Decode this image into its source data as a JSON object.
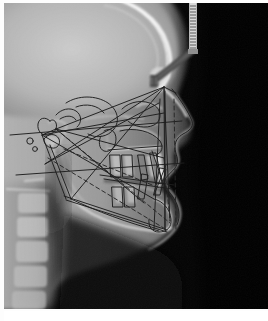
{
  "figure": {
    "kind": "lateral-cephalometric-radiograph",
    "modality": "X-ray",
    "view": "lateral / profile, patient facing right",
    "title": "",
    "caption": "",
    "frame": {
      "background_color": "#ffffff",
      "image_left": 4,
      "image_top": 3,
      "image_width": 264,
      "image_height": 306
    }
  },
  "radiograph": {
    "background_color": "#000000",
    "air_field_color": "#050505",
    "soft_tissue_color": "#8d8d8d",
    "bone_color": "#cfcfcf",
    "bright_bone_color": "#f2f2f2",
    "cranial_vault_color": "#b9b9b9",
    "anatomy_labels": [
      "cranial-vault",
      "frontal-bone",
      "orbital-rim",
      "nasal-bone",
      "maxilla",
      "mandible",
      "soft-tissue-profile",
      "nose",
      "upper-lip",
      "lower-lip",
      "chin",
      "cervical-vertebrae",
      "upper-incisor",
      "lower-incisor",
      "sella-turcica",
      "hard-palate"
    ]
  },
  "hardware": {
    "ruler": {
      "name": "calibration-ruler",
      "color": "#d9d9d9",
      "x": 189,
      "y": 3,
      "width": 7,
      "height": 48,
      "tick_count": 18
    },
    "ear_rod": {
      "name": "cephalostat-ear-rod",
      "color": "#4a4a4a",
      "description": "angled positioning bar descending left from ruler base"
    }
  },
  "tracing": {
    "line_color": "#202020",
    "dashed_line_color": "#2a2a2a",
    "stroke_width": 0.9,
    "landmarks": [
      {
        "name": "nasion",
        "x": 160,
        "y": 84
      },
      {
        "name": "sella",
        "x": 52,
        "y": 126
      },
      {
        "name": "porion",
        "x": 38,
        "y": 132
      },
      {
        "name": "orbitale",
        "x": 143,
        "y": 118
      },
      {
        "name": "basion",
        "x": 41,
        "y": 161
      },
      {
        "name": "articulare",
        "x": 44,
        "y": 158
      },
      {
        "name": "anterior-nasal-spine",
        "x": 158,
        "y": 143
      },
      {
        "name": "posterior-nasal-spine",
        "x": 104,
        "y": 146
      },
      {
        "name": "point-a",
        "x": 160,
        "y": 155
      },
      {
        "name": "point-b",
        "x": 163,
        "y": 205
      },
      {
        "name": "pogonion",
        "x": 166,
        "y": 218
      },
      {
        "name": "menton",
        "x": 161,
        "y": 227
      },
      {
        "name": "gnathion",
        "x": 163,
        "y": 224
      },
      {
        "name": "gonion",
        "x": 67,
        "y": 196
      },
      {
        "name": "condylion",
        "x": 46,
        "y": 142
      }
    ],
    "reference_lines": [
      {
        "name": "sella-nasion-line",
        "style": "solid"
      },
      {
        "name": "frankfort-horizontal",
        "style": "solid"
      },
      {
        "name": "palatal-plane",
        "style": "solid"
      },
      {
        "name": "mandibular-plane",
        "style": "solid"
      },
      {
        "name": "occlusal-plane",
        "style": "solid"
      },
      {
        "name": "facial-plane",
        "style": "solid"
      },
      {
        "name": "n-a-line",
        "style": "dashed"
      },
      {
        "name": "n-b-line",
        "style": "dashed"
      },
      {
        "name": "a-pog-line",
        "style": "dashed"
      },
      {
        "name": "y-axis",
        "style": "dashed"
      },
      {
        "name": "upper-incisor-axis",
        "style": "solid"
      },
      {
        "name": "lower-incisor-axis",
        "style": "solid"
      },
      {
        "name": "ramus-posterior-border",
        "style": "solid"
      },
      {
        "name": "symphysis-outline",
        "style": "solid"
      }
    ]
  }
}
